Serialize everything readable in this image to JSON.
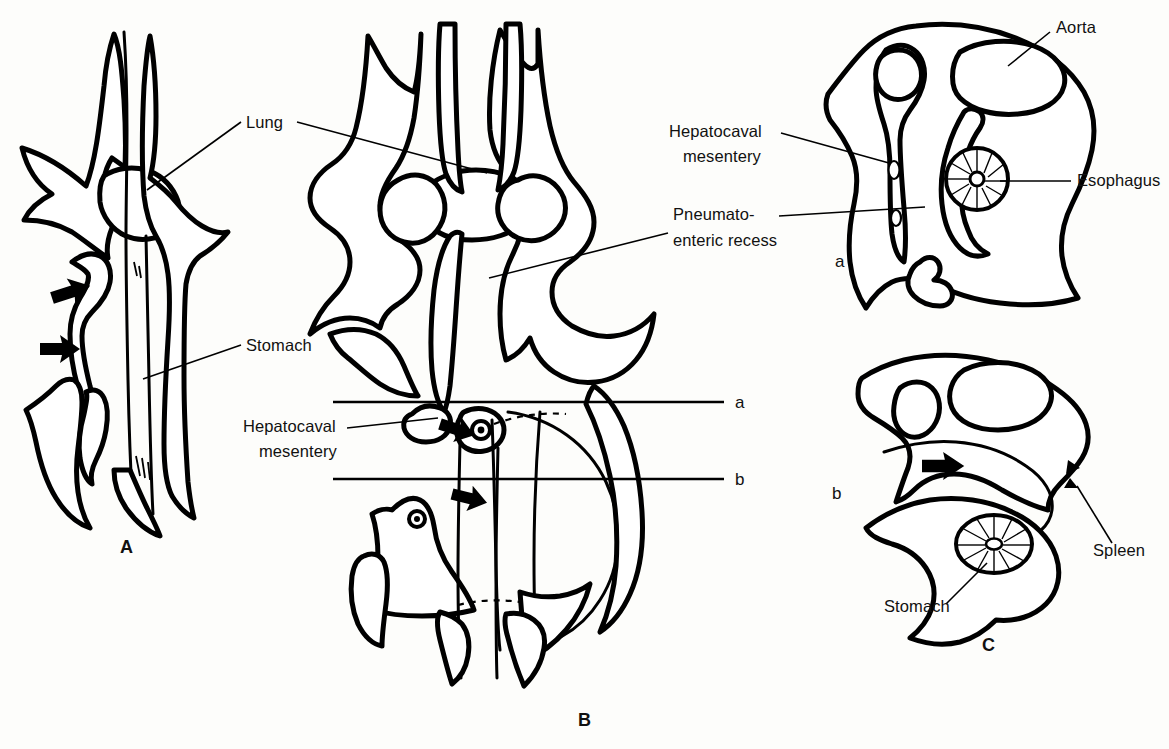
{
  "figure": {
    "background_color": "#fdfdfb",
    "ink_color": "#000000",
    "width": 1169,
    "height": 749
  },
  "panels": [
    {
      "id": "A",
      "letter": "A",
      "x": 120,
      "y": 553,
      "description": "Earliest stage, coronal view of lung buds and stomach"
    },
    {
      "id": "B",
      "letter": "B",
      "x": 578,
      "y": 726,
      "description": "Later stage, coronal view with section planes a and b"
    },
    {
      "id": "C",
      "letter": "C",
      "x": 982,
      "y": 651,
      "description": "Transverse sections a and b"
    }
  ],
  "section_planes": [
    {
      "id": "plane-a",
      "letter": "a",
      "y": 402,
      "x1": 333,
      "x2": 724,
      "label_x": 735,
      "label_y": 408
    },
    {
      "id": "plane-b",
      "letter": "b",
      "y": 479,
      "x1": 333,
      "x2": 724,
      "label_x": 735,
      "label_y": 485
    }
  ],
  "section_sublabels": [
    {
      "id": "section-a",
      "letter": "a",
      "x": 835,
      "y": 267
    },
    {
      "id": "section-b",
      "letter": "b",
      "x": 832,
      "y": 499
    }
  ],
  "labels": [
    {
      "id": "lung",
      "text": "Lung",
      "x": 246,
      "y": 128,
      "anchor": "start",
      "leaders": [
        {
          "from": [
            240,
            122
          ],
          "to": [
            146,
            190
          ]
        },
        {
          "from": [
            296,
            122
          ],
          "to": [
            486,
            172
          ]
        }
      ]
    },
    {
      "id": "stomach-a",
      "text": "Stomach",
      "x": 246,
      "y": 351,
      "anchor": "start",
      "leaders": [
        {
          "from": [
            240,
            346
          ],
          "to": [
            143,
            379
          ]
        }
      ]
    },
    {
      "id": "hepatocaval-mesentery-b",
      "text": "Hepatocaval",
      "text2": "mesentery",
      "x": 243,
      "y": 432,
      "x2": 259,
      "y2": 457,
      "anchor": "start",
      "leaders": [
        {
          "from": [
            345,
            428
          ],
          "to": [
            434,
            418
          ]
        }
      ]
    },
    {
      "id": "hepatocaval-mesentery-c",
      "text": "Hepatocaval",
      "text2": "mesentery",
      "x": 669,
      "y": 137,
      "x2": 683,
      "y2": 162,
      "anchor": "start",
      "leaders": [
        {
          "from": [
            780,
            133
          ],
          "to": [
            888,
            163
          ]
        }
      ]
    },
    {
      "id": "pneumatoenteric-recess",
      "text": "Pneumato-",
      "text2": "enteric recess",
      "x": 673,
      "y": 220,
      "x2": 673,
      "y2": 246,
      "anchor": "start",
      "leaders": [
        {
          "from": [
            778,
            216
          ],
          "to": [
            924,
            207
          ]
        },
        {
          "from": [
            669,
            232
          ],
          "to": [
            490,
            277
          ]
        }
      ]
    },
    {
      "id": "aorta",
      "text": "Aorta",
      "x": 1056,
      "y": 33,
      "anchor": "start",
      "leaders": [
        {
          "from": [
            1050,
            32
          ],
          "to": [
            1008,
            66
          ]
        }
      ]
    },
    {
      "id": "esophagus",
      "text": "Esophagus",
      "x": 1077,
      "y": 186,
      "anchor": "start",
      "leaders": [
        {
          "from": [
            1071,
            181
          ],
          "to": [
            1000,
            181
          ]
        }
      ]
    },
    {
      "id": "spleen",
      "text": "Spleen",
      "x": 1093,
      "y": 556,
      "anchor": "start",
      "leaders": [
        {
          "from": [
            1110,
            544
          ],
          "to": [
            1078,
            487
          ]
        }
      ]
    },
    {
      "id": "stomach-c",
      "text": "Stomach",
      "x": 884,
      "y": 612,
      "anchor": "start",
      "leaders": [
        {
          "from": [
            944,
            604
          ],
          "to": [
            986,
            564
          ]
        }
      ]
    }
  ],
  "arrows": [
    {
      "id": "arrow-a-upper",
      "x": 52,
      "y": 298,
      "angle": -20,
      "scale": 1.0
    },
    {
      "id": "arrow-a-lower",
      "x": 48,
      "y": 348,
      "angle": 0,
      "scale": 1.0
    },
    {
      "id": "arrow-b-upper",
      "x": 448,
      "y": 427,
      "angle": 15,
      "scale": 0.9
    },
    {
      "id": "arrow-b-lower",
      "x": 462,
      "y": 497,
      "angle": 12,
      "scale": 0.9
    },
    {
      "id": "arrow-c-lower",
      "x": 940,
      "y": 466,
      "angle": 0,
      "scale": 0.95
    }
  ],
  "structures": {
    "panel_a": [
      "lung bud left",
      "lung bud right",
      "stomach",
      "pneumatoenteric recess",
      "mesenchyme"
    ],
    "panel_b": [
      "lung",
      "pneumatoenteric recess",
      "hepatocaval mesentery",
      "stomach",
      "liver"
    ],
    "panel_c_a": [
      "aorta",
      "esophagus",
      "hepatocaval mesentery",
      "pneumatoenteric recess"
    ],
    "panel_c_b": [
      "stomach",
      "spleen",
      "aorta"
    ]
  }
}
